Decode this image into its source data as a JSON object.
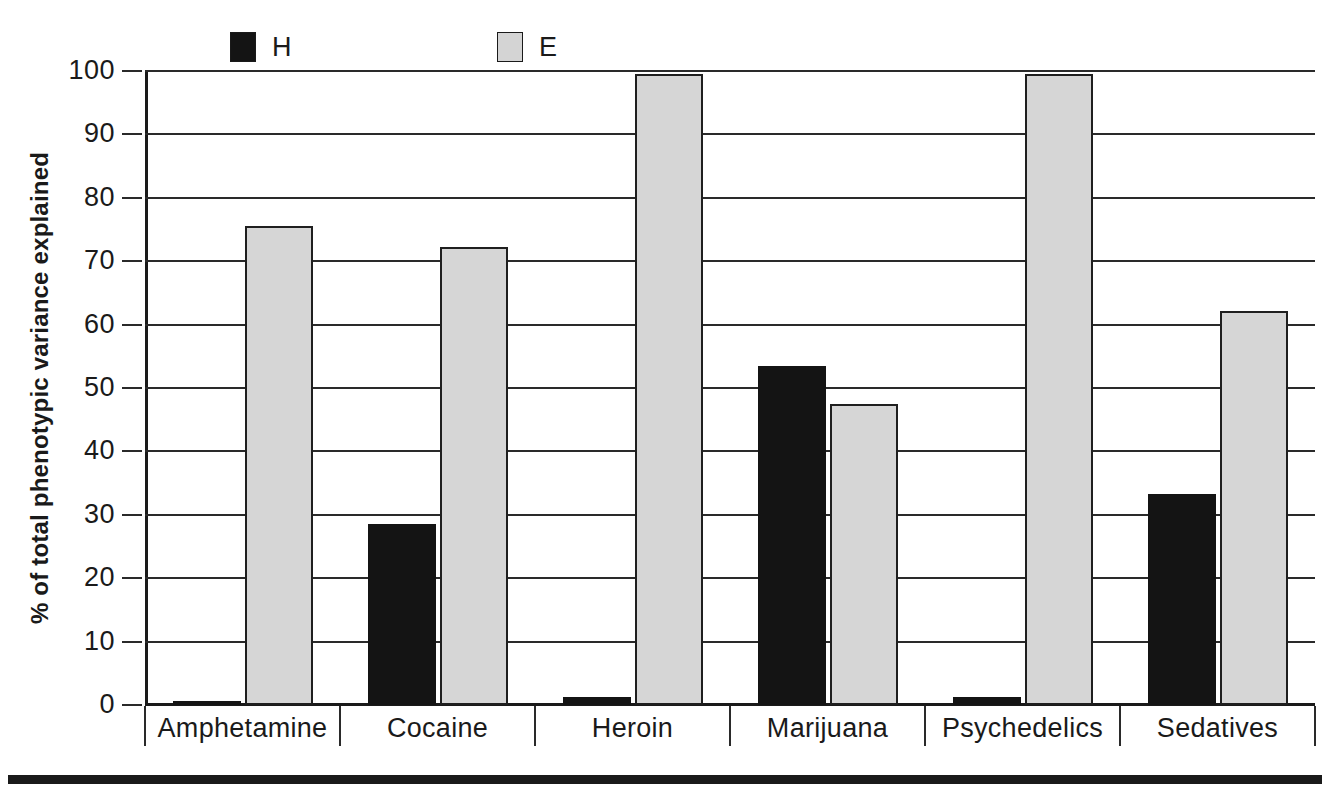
{
  "chart_data": {
    "type": "bar",
    "title": "",
    "subtitle": "",
    "xlabel": "",
    "ylabel": "% of total phenotypic variance explained",
    "ylim": [
      0,
      100
    ],
    "yticks": [
      0,
      10,
      20,
      30,
      40,
      50,
      60,
      70,
      80,
      90,
      100
    ],
    "ytick_labels": [
      "0",
      "10",
      "20",
      "30",
      "40",
      "50",
      "60",
      "70",
      "80",
      "90",
      "100"
    ],
    "grid": true,
    "grid_axis": "y",
    "legend_position": "top",
    "categories": [
      "Amphetamine",
      "Cocaine",
      "Heroin",
      "Marijuana",
      "Psychedelics",
      "Sedatives"
    ],
    "series": [
      {
        "name": "H",
        "color": "#141414",
        "values": [
          0.5,
          28.5,
          1.3,
          53.5,
          1.3,
          33.3
        ]
      },
      {
        "name": "E",
        "color": "#d6d6d6",
        "values": [
          75.5,
          72.2,
          99.5,
          47.5,
          99.5,
          62.2
        ]
      }
    ]
  },
  "legend": {
    "items": [
      {
        "label": "H",
        "swatch": "h"
      },
      {
        "label": "E",
        "swatch": "e"
      }
    ]
  },
  "colors": {
    "h_fill": "#141414",
    "e_fill": "#d6d6d6",
    "axis": "#1a1a1a",
    "grid": "#2a2a2a",
    "background": "#ffffff"
  }
}
